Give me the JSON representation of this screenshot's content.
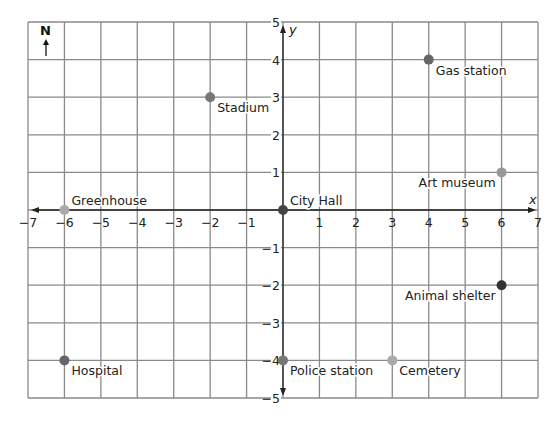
{
  "chart_data": {
    "type": "scatter",
    "title": "",
    "xlabel": "x",
    "ylabel": "y",
    "xlim": [
      -7,
      7
    ],
    "ylim": [
      -5,
      5
    ],
    "grid": true,
    "compass": "N",
    "x_ticks": [
      "−7",
      "−6",
      "−5",
      "−4",
      "−3",
      "−2",
      "−1",
      "1",
      "2",
      "3",
      "4",
      "5",
      "6",
      "7"
    ],
    "y_ticks": [
      "5",
      "4",
      "3",
      "2",
      "1",
      "−1",
      "−2",
      "−3",
      "−4",
      "−5"
    ],
    "points": [
      {
        "name": "Gas station",
        "x": 4,
        "y": 4,
        "color": "#666666"
      },
      {
        "name": "Stadium",
        "x": -2,
        "y": 3,
        "color": "#777777"
      },
      {
        "name": "Art museum",
        "x": 6,
        "y": 1,
        "color": "#999999"
      },
      {
        "name": "Greenhouse",
        "x": -6,
        "y": 0,
        "color": "#aaaaaa"
      },
      {
        "name": "City Hall",
        "x": 0,
        "y": 0,
        "color": "#444444"
      },
      {
        "name": "Animal shelter",
        "x": 6,
        "y": -2,
        "color": "#333333"
      },
      {
        "name": "Hospital",
        "x": -6,
        "y": -4,
        "color": "#666666"
      },
      {
        "name": "Police station",
        "x": 0,
        "y": -4,
        "color": "#777777"
      },
      {
        "name": "Cemetery",
        "x": 3,
        "y": -4,
        "color": "#aaaaaa"
      }
    ]
  }
}
